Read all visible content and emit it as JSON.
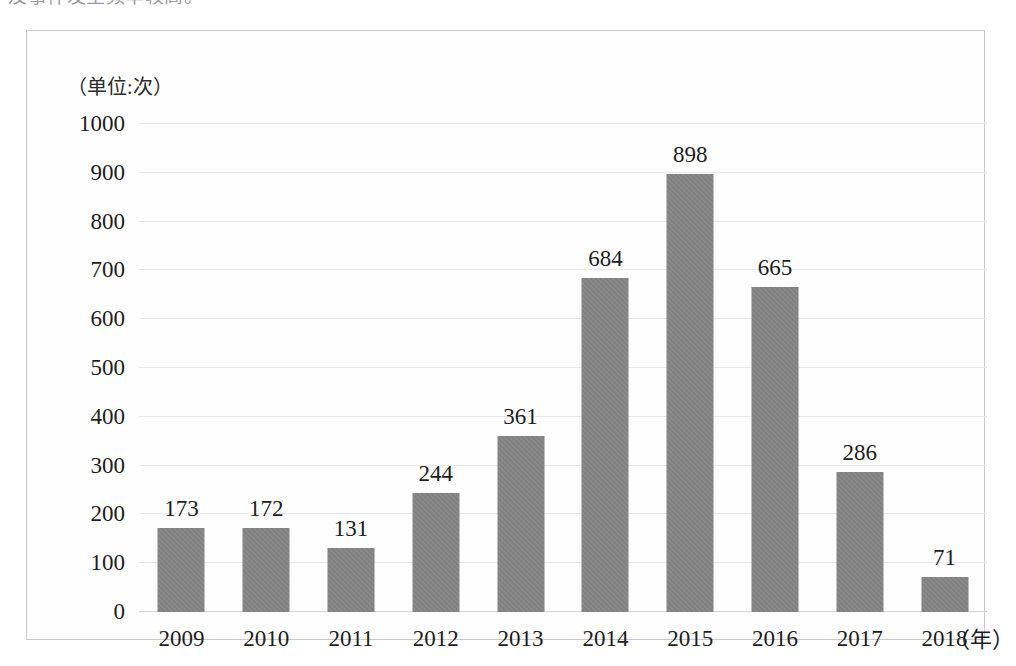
{
  "page": {
    "top_cutoff_text": "及事件发生频率较高。"
  },
  "figure": {
    "unit_caption": "（单位:次）",
    "xaxis_unit": "（年）"
  },
  "chart_data": {
    "type": "bar",
    "title": "",
    "subtitle": "",
    "xlabel": "（年）",
    "ylabel": "（单位:次）",
    "categories": [
      "2009",
      "2010",
      "2011",
      "2012",
      "2013",
      "2014",
      "2015",
      "2016",
      "2017",
      "2018"
    ],
    "values": [
      173,
      172,
      131,
      244,
      361,
      684,
      898,
      665,
      286,
      71
    ],
    "data_labels": [
      "173",
      "172",
      "131",
      "244",
      "361",
      "684",
      "898",
      "665",
      "286",
      "71"
    ],
    "ylim": [
      0,
      1000
    ],
    "ytick_values": [
      1000,
      900,
      800,
      700,
      600,
      500,
      400,
      300,
      200,
      100,
      0
    ],
    "ytick_labels": [
      "1000",
      "900",
      "800",
      "700",
      "600",
      "500",
      "400",
      "300",
      "200",
      "100",
      "0"
    ],
    "grid": true,
    "grid_axis": "y",
    "legend": false,
    "legend_position": "none",
    "series": [
      {
        "name": "次数",
        "color": "#808080",
        "values": [
          173,
          172,
          131,
          244,
          361,
          684,
          898,
          665,
          286,
          71
        ]
      }
    ],
    "colors": {
      "bar": "#808080",
      "gridline": "#e9e9ec",
      "baseline": "#d5d5d8",
      "frame": "#c9c9cc",
      "text": "#1d1d1d",
      "background": "#fefefe"
    }
  }
}
